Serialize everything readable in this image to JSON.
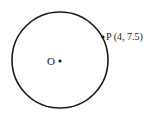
{
  "diagram": {
    "circle": {
      "cx": 60,
      "cy": 60,
      "r": 48,
      "stroke": "#1a1a1a"
    },
    "center": {
      "label": "O",
      "x": 60,
      "y": 61
    },
    "point": {
      "label": "P (4, 7.5)",
      "name": "P",
      "coords": [
        4,
        7.5
      ],
      "x": 103,
      "y": 37
    }
  }
}
